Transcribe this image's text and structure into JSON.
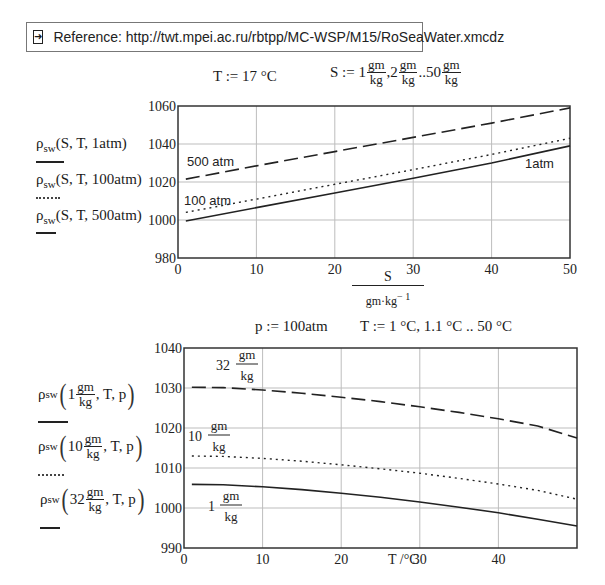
{
  "reference": {
    "icon": "arrow-right-boxed-icon",
    "text": "Reference: http://twt.mpei.ac.ru/rbtpp/MC-WSP/M15/RoSeaWater.xmcdz"
  },
  "top_definitions": {
    "T_def": "T :=  17 °C",
    "S_def_prefix": "S :=  1",
    "S_def_mid1": ",2",
    "S_def_mid2": "..50",
    "unit_num": "gm",
    "unit_den": "kg"
  },
  "top_legend": [
    {
      "func": "ρ",
      "sub": "sw",
      "args": "(S, T, 1atm)",
      "style": "solid"
    },
    {
      "func": "ρ",
      "sub": "sw",
      "args": "(S, T, 100atm)",
      "style": "dotted"
    },
    {
      "func": "ρ",
      "sub": "sw",
      "args": "(S, T, 500atm)",
      "style": "dashed"
    }
  ],
  "top_xlabel": {
    "num": "S",
    "den": "gm·kg",
    "exp": "− 1"
  },
  "bottom_definitions": {
    "p_def": "p :=  100atm",
    "T_def": "T :=  1 °C, 1.1 °C .. 50 °C"
  },
  "bottom_legend": [
    {
      "func": "ρ",
      "sub": "sw",
      "value": "1",
      "num": "gm",
      "den": "kg",
      "tail": ", T, p",
      "style": "solid"
    },
    {
      "func": "ρ",
      "sub": "sw",
      "value": "10",
      "num": "gm",
      "den": "kg",
      "tail": ", T, p",
      "style": "dotted"
    },
    {
      "func": "ρ",
      "sub": "sw",
      "value": "32",
      "num": "gm",
      "den": "kg",
      "tail": ", T, p",
      "style": "dashed"
    }
  ],
  "bottom_xlabel": "T /°C",
  "chart_data": [
    {
      "type": "line",
      "title": "",
      "xlabel": "S / (gm·kg^-1)",
      "ylabel": "ρsw(S,T,p)",
      "xlim": [
        0,
        50
      ],
      "ylim": [
        980,
        1060
      ],
      "xticks": [
        0,
        10,
        20,
        30,
        40,
        50
      ],
      "yticks": [
        980,
        1000,
        1020,
        1040,
        1060
      ],
      "grid": true,
      "x": [
        1,
        10,
        20,
        30,
        40,
        50
      ],
      "series": [
        {
          "name": "ρsw(S, T, 1atm)",
          "label": "1atm",
          "style": "solid",
          "values": [
            999.5,
            1006.5,
            1014.2,
            1022.0,
            1030.0,
            1039.0
          ]
        },
        {
          "name": "ρsw(S, T, 100atm)",
          "label": "100 atm",
          "style": "dotted",
          "values": [
            1004.0,
            1011.0,
            1018.8,
            1026.5,
            1034.5,
            1043.0
          ]
        },
        {
          "name": "ρsw(S, T, 500atm)",
          "label": "500 atm",
          "style": "dashed",
          "values": [
            1021.5,
            1028.5,
            1036.0,
            1043.5,
            1051.0,
            1059.0
          ]
        }
      ],
      "annotations": [
        "500 atm",
        "100 atm",
        "1atm"
      ]
    },
    {
      "type": "line",
      "title": "",
      "xlabel": "T /°C",
      "ylabel": "ρsw(S,T,p)",
      "xlim": [
        0,
        50
      ],
      "ylim": [
        990,
        1040
      ],
      "xticks": [
        0,
        10,
        20,
        30,
        40
      ],
      "yticks": [
        990,
        1000,
        1010,
        1020,
        1030,
        1040
      ],
      "grid": true,
      "x": [
        1,
        5,
        10,
        15,
        20,
        25,
        30,
        35,
        40,
        45,
        50
      ],
      "series": [
        {
          "name": "ρsw(1 gm/kg, T, p)",
          "label": "1 gm/kg",
          "style": "solid",
          "values": [
            1005.9,
            1005.8,
            1005.3,
            1004.6,
            1003.7,
            1002.7,
            1001.5,
            1000.2,
            998.8,
            997.2,
            995.5
          ]
        },
        {
          "name": "ρsw(10 gm/kg, T, p)",
          "label": "10 gm/kg",
          "style": "dotted",
          "values": [
            1013.0,
            1012.9,
            1012.4,
            1011.7,
            1010.8,
            1009.8,
            1008.7,
            1007.4,
            1006.0,
            1004.4,
            1002.2
          ]
        },
        {
          "name": "ρsw(32 gm/kg, T, p)",
          "label": "32 gm/kg",
          "style": "dashed",
          "values": [
            1030.2,
            1030.1,
            1029.5,
            1028.7,
            1027.7,
            1026.6,
            1025.3,
            1023.9,
            1022.3,
            1020.5,
            1017.5
          ]
        }
      ],
      "annotations": [
        "32 gm/kg",
        "10 gm/kg",
        "1 gm/kg"
      ]
    }
  ]
}
